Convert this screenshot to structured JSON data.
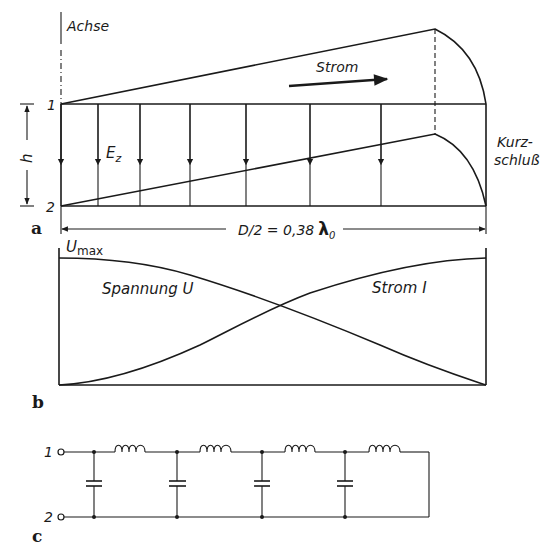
{
  "figure": {
    "panel_a": {
      "panel_label": "a",
      "axis_label": "Achse",
      "conductor_1_label": "1",
      "conductor_2_label": "2",
      "height_label": "h",
      "field_label": "E",
      "field_subscript": "z",
      "current_label": "Strom",
      "short_circuit_label_line1": "Kurz-",
      "short_circuit_label_line2": "schluß",
      "dimension_label": "D/2 = 0,38",
      "dimension_symbol": "λ",
      "dimension_subscript": "0"
    },
    "panel_b": {
      "panel_label": "b",
      "umax_label": "U",
      "umax_subscript": "max",
      "voltage_label": "Spannung U",
      "current_label": "Strom I"
    },
    "panel_c": {
      "panel_label": "c",
      "terminal_1_label": "1",
      "terminal_2_label": "2",
      "sections": 4
    },
    "colors": {
      "ink": "#1a1a1a",
      "background": "#ffffff"
    }
  }
}
